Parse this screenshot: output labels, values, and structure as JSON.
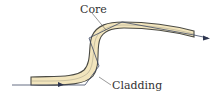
{
  "diagram": {
    "labels": {
      "core": "Core",
      "cladding": "Cladding"
    },
    "colors": {
      "fiber_fill": "#f2e5bd",
      "outline": "#4a4a44",
      "ray": "#3f4a66",
      "leader": "#555555",
      "background": "#ffffff"
    },
    "elements": [
      {
        "name": "fiber",
        "type": "curved-band",
        "shape": "S-bend from lower-left to upper-right"
      },
      {
        "name": "light-ray",
        "type": "zig-zag path with arrows",
        "direction": "left to right"
      },
      {
        "name": "core-leader",
        "type": "leader line",
        "target": "core"
      },
      {
        "name": "cladding-leader",
        "type": "leader line",
        "target": "cladding"
      }
    ]
  }
}
